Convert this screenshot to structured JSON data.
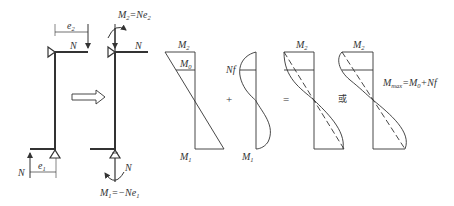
{
  "figure": {
    "colors": {
      "stroke": "#333333",
      "background": "#ffffff"
    }
  },
  "left_column": {
    "force_top": "N",
    "force_bottom": "N",
    "eccentricity_top": "e",
    "eccentricity_top_sub": "2",
    "eccentricity_bottom": "e",
    "eccentricity_bottom_sub": "1"
  },
  "transform_arrow": {
    "icon": "hollow-right-arrow"
  },
  "right_column": {
    "force_top": "N",
    "force_bottom": "N",
    "moment_top": {
      "symbol": "M",
      "sub": "2",
      "eq": "=Ne",
      "eq_sub": "2"
    },
    "moment_bottom": {
      "symbol": "M",
      "sub": "1",
      "eq": "=−Ne",
      "eq_sub": "1"
    }
  },
  "moment_diagrams": {
    "first_order": {
      "top_label": "M",
      "top_sub": "2",
      "mid_label": "M",
      "mid_sub": "0",
      "bottom_label": "M",
      "bottom_sub": "1"
    },
    "plus_sign": "+",
    "second_order": {
      "left_label": "Nf",
      "bottom_label": "M",
      "bottom_sub": "1"
    },
    "equals_sign": "=",
    "result_a": {
      "top_label": "M",
      "top_sub": "2"
    },
    "or_text": "或",
    "result_b": {
      "top_label": "M",
      "top_sub": "2"
    },
    "formula": {
      "lhs": "M",
      "lhs_sub": "max",
      "eq": "=M",
      "eq_sub": "0",
      "rest": "+Nf"
    }
  }
}
